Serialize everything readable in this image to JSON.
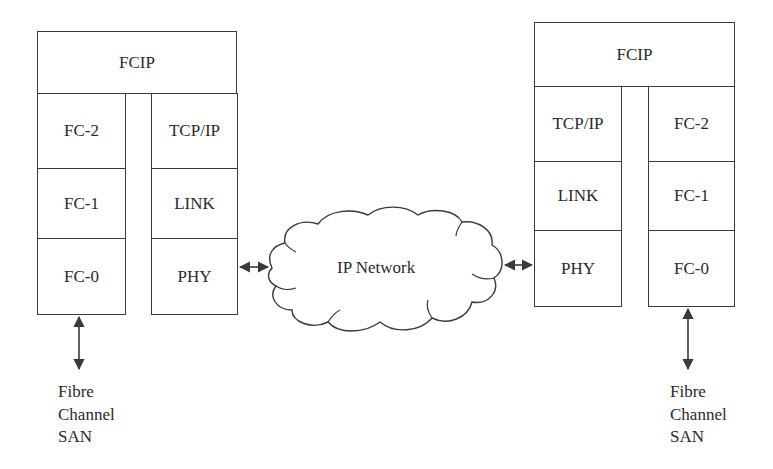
{
  "diagram": {
    "type": "protocol-stack",
    "left_stack": {
      "top": "FCIP",
      "fc_column": [
        "FC-2",
        "FC-1",
        "FC-0"
      ],
      "ip_column": [
        "TCP/IP",
        "LINK",
        "PHY"
      ]
    },
    "right_stack": {
      "top": "FCIP",
      "ip_column": [
        "TCP/IP",
        "LINK",
        "PHY"
      ],
      "fc_column": [
        "FC-2",
        "FC-1",
        "FC-0"
      ]
    },
    "network": {
      "label": "IP Network",
      "icon": "cloud-icon"
    },
    "endpoints": {
      "left": [
        "Fibre",
        "Channel",
        "SAN"
      ],
      "right": [
        "Fibre",
        "Channel",
        "SAN"
      ]
    },
    "connections": [
      {
        "from": "left_stack.PHY",
        "to": "network",
        "type": "bidirectional-arrow"
      },
      {
        "from": "network",
        "to": "right_stack.PHY",
        "type": "bidirectional-arrow"
      },
      {
        "from": "left_stack.FC-0",
        "to": "endpoints.left",
        "type": "bidirectional-arrow"
      },
      {
        "from": "right_stack.FC-0",
        "to": "endpoints.right",
        "type": "bidirectional-arrow"
      }
    ],
    "colors": {
      "line": "#3a3a3a",
      "text": "#2a2a2a",
      "background": "#ffffff"
    }
  }
}
